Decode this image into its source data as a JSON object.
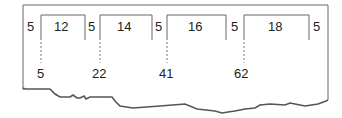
{
  "diagram": {
    "gap_labels": [
      "5",
      "5",
      "5",
      "5",
      "5"
    ],
    "box_labels": [
      "12",
      "14",
      "16",
      "18"
    ],
    "position_labels": [
      "5",
      "22",
      "41",
      "62"
    ],
    "line_color": "#555555"
  }
}
